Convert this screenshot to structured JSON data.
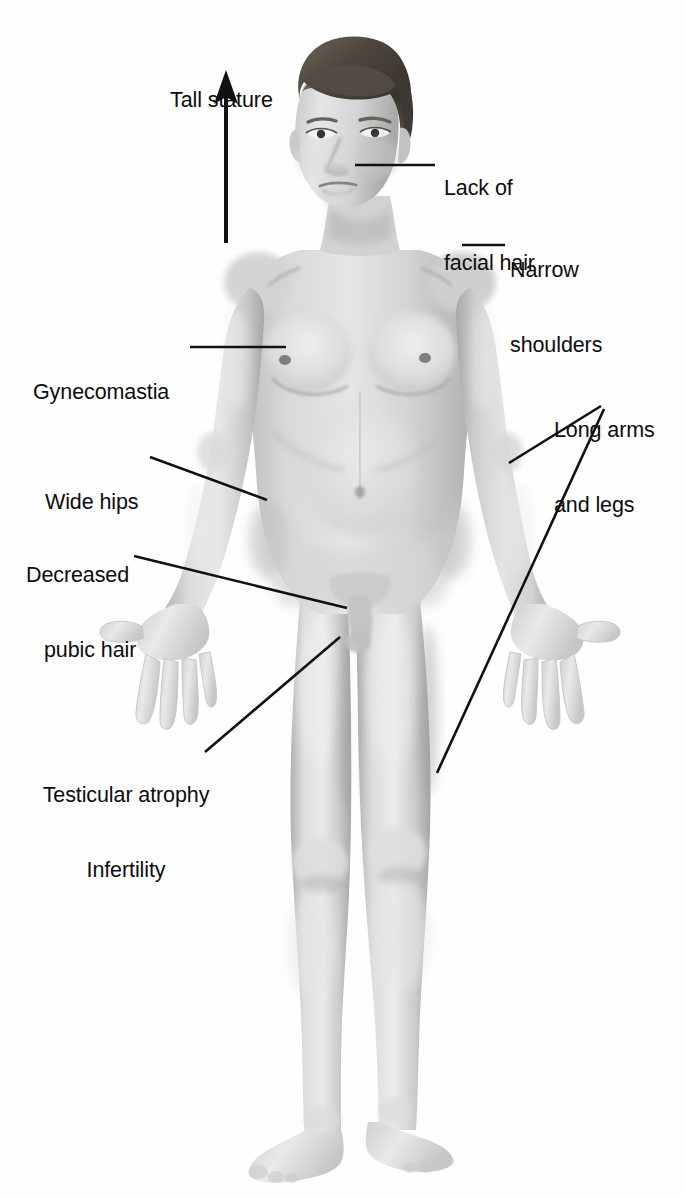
{
  "diagram": {
    "background_color": "#ffffff",
    "line_color": "#111111",
    "text_color": "#0d0d0d",
    "skin_light": "#e4e4e4",
    "skin_mid": "#c9c9c9",
    "skin_shadow": "#a8a8a8",
    "hair_color": "#4a4440"
  },
  "annotations": [
    {
      "id": "tall-stature",
      "lines": [
        "Tall stature"
      ],
      "x": 170,
      "y": 38,
      "align": "left",
      "marker": "arrow-up"
    },
    {
      "id": "lack-of-facial-hair",
      "lines": [
        "Lack of",
        "facial hair"
      ],
      "x": 444,
      "y": 126,
      "align": "left",
      "marker": "leader-line"
    },
    {
      "id": "narrow-shoulders",
      "lines": [
        "Narrow",
        "shoulders"
      ],
      "x": 510,
      "y": 208,
      "align": "left",
      "marker": "leader-line"
    },
    {
      "id": "long-arms-and-legs",
      "lines": [
        "Long arms",
        "and legs"
      ],
      "x": 554,
      "y": 368,
      "align": "left",
      "marker": "double-leader-line"
    },
    {
      "id": "gynecomastia",
      "lines": [
        "Gynecomastia"
      ],
      "x": 33,
      "y": 330,
      "align": "left",
      "marker": "leader-line"
    },
    {
      "id": "wide-hips",
      "lines": [
        "Wide hips"
      ],
      "x": 45,
      "y": 440,
      "align": "left",
      "marker": "leader-line"
    },
    {
      "id": "decreased-pubic-hair",
      "lines": [
        "Decreased",
        "pubic hair"
      ],
      "x": 26,
      "y": 513,
      "align": "left",
      "marker": "leader-line"
    },
    {
      "id": "testicular-atrophy-infertility",
      "lines": [
        "Testicular atrophy",
        "Infertility"
      ],
      "x": 28,
      "y": 733,
      "align": "center",
      "marker": "leader-line"
    }
  ],
  "leader_lines": [
    {
      "id": "leader-facial-hair",
      "points": "355,165 435,165"
    },
    {
      "id": "leader-narrow-shoulders",
      "points": "462,245 505,245"
    },
    {
      "id": "leader-gynecomastia",
      "points": "190,347 286,347"
    },
    {
      "id": "leader-wide-hips",
      "points": "150,457 267,500"
    },
    {
      "id": "leader-pubic-hair",
      "points": "134,556 347,608"
    },
    {
      "id": "leader-testicular-atrophy",
      "points": "205,752 340,637"
    },
    {
      "id": "leader-long-arms-upper",
      "points": "601,406 509,463"
    },
    {
      "id": "leader-long-arms-lower",
      "points": "604,409 437,773"
    }
  ],
  "arrow": {
    "id": "tall-stature-arrow",
    "x": 226,
    "tip_y": 72,
    "tail_y": 243,
    "head_width": 20,
    "head_height": 30
  }
}
